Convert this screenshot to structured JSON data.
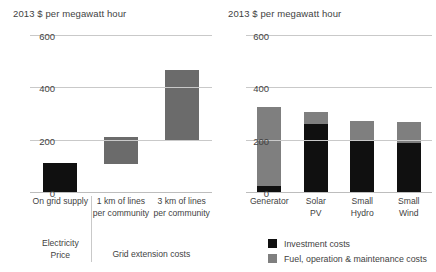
{
  "colors": {
    "investment": "#101010",
    "fuel_om": "#7f7f7f",
    "range_bar": "#6b6b6b",
    "range_bar_dark": "#101010",
    "gridline": "#c9c9c9",
    "text": "#3f3f3f"
  },
  "panels": {
    "left": {
      "title": "2013 $ per megawatt hour",
      "yticks": [
        "600",
        "400",
        "200",
        "0"
      ],
      "categories": [
        "On grid\nsupply",
        "1 km of lines\nper\ncommunity",
        "3 km of lines\nper\ncommunity"
      ],
      "groups": [
        "Electricity\nPrice",
        "Grid extension costs"
      ]
    },
    "right": {
      "title": "2013 $ per megawatt hour",
      "yticks": [
        "600",
        "400",
        "200",
        "0"
      ],
      "categories": [
        "Generator",
        "Solar\nPV",
        "Small\nHydro",
        "Small\nWind"
      ],
      "legend": [
        {
          "label": "Investment costs",
          "swatch": "#101010"
        },
        {
          "label": "Fuel, operation & maintenance costs",
          "swatch": "#7f7f7f"
        }
      ]
    }
  },
  "chart_data": [
    {
      "type": "bar",
      "subtype": "floating-range",
      "title": "2013 $ per megawatt hour",
      "xlabel": "",
      "ylabel": "2013 $ per megawatt hour",
      "ylim": [
        0,
        600
      ],
      "yticks": [
        0,
        200,
        400,
        600
      ],
      "grid": true,
      "legend": "none",
      "categories": [
        "On grid supply",
        "1 km of lines per community",
        "3 km of lines per community"
      ],
      "groups": [
        {
          "name": "Electricity Price",
          "categories": [
            "On grid supply"
          ]
        },
        {
          "name": "Grid extension costs",
          "categories": [
            "1 km of lines per community",
            "3 km of lines per community"
          ]
        }
      ],
      "series": [
        {
          "name": "low",
          "values": [
            0,
            110,
            200
          ]
        },
        {
          "name": "high",
          "values": [
            115,
            215,
            470
          ]
        }
      ],
      "bar_colors": [
        "#101010",
        "#6b6b6b",
        "#6b6b6b"
      ]
    },
    {
      "type": "bar",
      "subtype": "stacked",
      "title": "2013 $ per megawatt hour",
      "xlabel": "",
      "ylabel": "2013 $ per megawatt hour",
      "ylim": [
        0,
        600
      ],
      "yticks": [
        0,
        200,
        400,
        600
      ],
      "grid": true,
      "legend": "bottom",
      "categories": [
        "Generator",
        "Solar PV",
        "Small Hydro",
        "Small Wind"
      ],
      "series": [
        {
          "name": "Investment costs",
          "color": "#101010",
          "values": [
            25,
            265,
            200,
            190
          ]
        },
        {
          "name": "Fuel, operation & maintenance costs",
          "color": "#7f7f7f",
          "values": [
            305,
            45,
            75,
            80
          ]
        }
      ],
      "totals": [
        330,
        310,
        275,
        270
      ]
    }
  ]
}
